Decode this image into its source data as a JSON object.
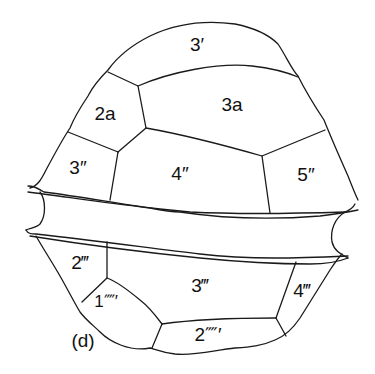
{
  "figure": {
    "panel_label": "(d)",
    "plates": {
      "apical_3": "3′",
      "intercalary_2a": "2a",
      "intercalary_3a": "3a",
      "precingular_3": "3″",
      "precingular_4": "4″",
      "precingular_5": "5″",
      "postcingular_2": "2‴",
      "postcingular_3": "3‴",
      "postcingular_4": "4‴",
      "antapical_1": "1⁗′",
      "antapical_2": "2⁗′"
    },
    "stroke_color": "#1a1a1a",
    "background": "#ffffff"
  }
}
